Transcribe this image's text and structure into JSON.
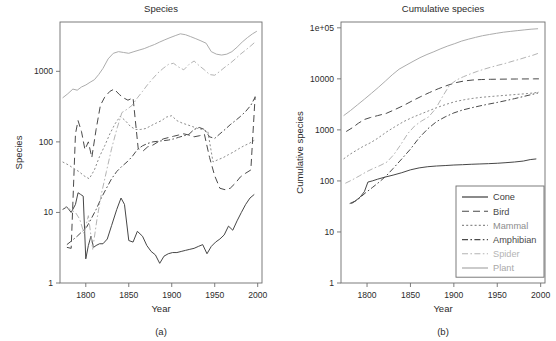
{
  "figure": {
    "caption_a": "(a)",
    "caption_b": "(b)"
  },
  "panel_a": {
    "title": "Species",
    "xlabel": "Year",
    "ylabel": "Species"
  },
  "panel_b": {
    "title": "Cumulative species",
    "xlabel": "Year",
    "ylabel": "Cumulative species"
  },
  "legend": {
    "items": [
      {
        "label": "Cone",
        "color": "#3c3c3c",
        "dash": "none",
        "key": "cone"
      },
      {
        "label": "Bird",
        "color": "#4a4a4a",
        "dash": "long",
        "key": "bird"
      },
      {
        "label": "Mammal",
        "color": "#8c8c8c",
        "dash": "dot",
        "key": "mammal"
      },
      {
        "label": "Amphibian",
        "color": "#4a4a4a",
        "dash": "dashdot",
        "key": "amphibian"
      },
      {
        "label": "Spider",
        "color": "#b4b4b4",
        "dash": "dashdot",
        "key": "spider"
      },
      {
        "label": "Plant",
        "color": "#a8a8a8",
        "dash": "none",
        "key": "plant"
      }
    ]
  },
  "chart_data": [
    {
      "type": "line",
      "panel": "a",
      "title": "Species",
      "xlabel": "Year",
      "ylabel": "Species",
      "yscale": "log",
      "xlim": [
        1770,
        2005
      ],
      "ylim": [
        1,
        5000
      ],
      "xticks": [
        1800,
        1850,
        1900,
        1950,
        2000
      ],
      "xticklabels": [
        "1800",
        "1850",
        "1900",
        "1950",
        "2000"
      ],
      "yticks": [
        1,
        10,
        100,
        1000
      ],
      "yticklabels": [
        "1",
        "10",
        "100",
        "1000"
      ],
      "grid": false,
      "legend_position": "none",
      "series": [
        {
          "name": "Cone",
          "x": [
            1773,
            1778,
            1783,
            1788,
            1791,
            1794,
            1797,
            1800,
            1803,
            1806,
            1809,
            1812,
            1816,
            1820,
            1825,
            1830,
            1836,
            1841,
            1845,
            1850,
            1855,
            1860,
            1866,
            1871,
            1876,
            1881,
            1886,
            1891,
            1896,
            1901,
            1906,
            1911,
            1916,
            1921,
            1926,
            1931,
            1936,
            1941,
            1946,
            1951,
            1956,
            1961,
            1966,
            1971,
            1976,
            1981,
            1986,
            1991,
            1996
          ],
          "y": [
            11,
            12,
            10,
            13,
            19,
            18,
            17,
            2.2,
            3.4,
            4.6,
            3.2,
            3.4,
            3.6,
            3.6,
            4.2,
            6.5,
            11,
            16,
            13,
            4.0,
            3.8,
            5.4,
            4.6,
            3.4,
            2.8,
            2.5,
            1.9,
            2.4,
            2.6,
            2.7,
            2.7,
            2.8,
            2.9,
            3.0,
            3.1,
            3.3,
            3.5,
            2.6,
            3.3,
            3.8,
            4.2,
            4.8,
            6.4,
            5.6,
            7.6,
            10,
            13,
            16,
            18
          ]
        },
        {
          "name": "Bird",
          "x": [
            1778,
            1783,
            1788,
            1791,
            1795,
            1799,
            1803,
            1807,
            1812,
            1817,
            1822,
            1828,
            1833,
            1839,
            1844,
            1849,
            1855,
            1861,
            1867,
            1872,
            1878,
            1884,
            1890,
            1896,
            1902,
            1908,
            1914,
            1920,
            1926,
            1932,
            1938,
            1944,
            1950,
            1956,
            1962,
            1968,
            1974,
            1980,
            1986,
            1992,
            1997
          ],
          "y": [
            3.2,
            3.1,
            130,
            200,
            140,
            78,
            100,
            60,
            150,
            330,
            430,
            520,
            560,
            470,
            420,
            390,
            420,
            80,
            75,
            85,
            90,
            100,
            110,
            115,
            120,
            125,
            130,
            125,
            118,
            122,
            128,
            60,
            33,
            22,
            21,
            22,
            26,
            32,
            36,
            40,
            440
          ]
        },
        {
          "name": "Mammal",
          "x": [
            1773,
            1780,
            1786,
            1792,
            1798,
            1804,
            1810,
            1816,
            1822,
            1828,
            1834,
            1840,
            1846,
            1852,
            1858,
            1864,
            1870,
            1876,
            1882,
            1888,
            1894,
            1900,
            1906,
            1912,
            1918,
            1924,
            1930,
            1936,
            1942,
            1948,
            1954,
            1960,
            1966,
            1972,
            1978,
            1984,
            1990,
            1996
          ],
          "y": [
            52,
            47,
            42,
            38,
            33,
            30,
            40,
            62,
            88,
            130,
            180,
            230,
            200,
            165,
            150,
            150,
            155,
            170,
            185,
            200,
            225,
            235,
            200,
            185,
            175,
            165,
            155,
            150,
            140,
            52,
            56,
            60,
            66,
            72,
            80,
            88,
            95,
            105
          ]
        },
        {
          "name": "Amphibian",
          "x": [
            1778,
            1784,
            1790,
            1796,
            1801,
            1806,
            1812,
            1818,
            1824,
            1830,
            1836,
            1842,
            1848,
            1854,
            1860,
            1866,
            1872,
            1878,
            1884,
            1890,
            1896,
            1902,
            1908,
            1914,
            1920,
            1926,
            1932,
            1938,
            1944,
            1950,
            1956,
            1962,
            1968,
            1974,
            1980,
            1986,
            1992,
            1997
          ],
          "y": [
            3.5,
            4.0,
            4.6,
            5.4,
            6.2,
            8.0,
            11,
            16,
            22,
            30,
            38,
            45,
            52,
            62,
            78,
            88,
            95,
            100,
            102,
            104,
            106,
            110,
            116,
            122,
            128,
            150,
            160,
            150,
            118,
            112,
            130,
            150,
            175,
            200,
            230,
            270,
            330,
            430
          ]
        },
        {
          "name": "Spider",
          "x": [
            1776,
            1782,
            1788,
            1793,
            1798,
            1803,
            1808,
            1813,
            1818,
            1824,
            1830,
            1836,
            1842,
            1848,
            1854,
            1860,
            1866,
            1872,
            1878,
            1884,
            1890,
            1896,
            1902,
            1908,
            1914,
            1920,
            1926,
            1932,
            1938,
            1944,
            1950,
            1956,
            1962,
            1968,
            1974,
            1980,
            1986,
            1992,
            1997
          ],
          "y": [
            12,
            11,
            10,
            8.0,
            5.0,
            9.0,
            3.0,
            8.0,
            18,
            38,
            80,
            150,
            260,
            290,
            330,
            420,
            520,
            650,
            790,
            950,
            1100,
            1250,
            1300,
            1150,
            1050,
            1250,
            1400,
            1200,
            1050,
            900,
            880,
            1000,
            1150,
            1300,
            1500,
            1750,
            2000,
            2300,
            2600
          ]
        },
        {
          "name": "Plant",
          "x": [
            1773,
            1779,
            1785,
            1790,
            1795,
            1800,
            1805,
            1810,
            1815,
            1820,
            1826,
            1832,
            1838,
            1844,
            1850,
            1856,
            1862,
            1868,
            1874,
            1880,
            1886,
            1892,
            1898,
            1904,
            1910,
            1916,
            1922,
            1928,
            1934,
            1940,
            1946,
            1952,
            1958,
            1964,
            1970,
            1976,
            1982,
            1988,
            1994,
            1999
          ],
          "y": [
            420,
            480,
            560,
            540,
            600,
            640,
            700,
            760,
            900,
            1100,
            1500,
            1800,
            1900,
            1850,
            1800,
            1900,
            2000,
            2100,
            2250,
            2400,
            2600,
            2800,
            3000,
            3200,
            3400,
            3300,
            3100,
            2900,
            2700,
            2500,
            1900,
            1750,
            1700,
            1750,
            1900,
            2200,
            2600,
            3000,
            3400,
            3700
          ]
        }
      ]
    },
    {
      "type": "line",
      "panel": "b",
      "title": "Cumulative species",
      "xlabel": "Year",
      "ylabel": "Cumulative species",
      "yscale": "log",
      "xlim": [
        1770,
        2005
      ],
      "ylim": [
        1,
        130000
      ],
      "xticks": [
        1800,
        1850,
        1900,
        1950,
        2000
      ],
      "xticklabels": [
        "1800",
        "1850",
        "1900",
        "1950",
        "2000"
      ],
      "yticks": [
        1,
        10,
        100,
        1000,
        10000,
        100000
      ],
      "yticklabels": [
        "1",
        "10",
        "100",
        "1000",
        "10000",
        "1e+05"
      ],
      "grid": false,
      "legend_position": "lower-right",
      "series": [
        {
          "name": "Cone",
          "x": [
            1780,
            1786,
            1792,
            1797,
            1801,
            1806,
            1812,
            1820,
            1830,
            1840,
            1850,
            1860,
            1870,
            1880,
            1890,
            1900,
            1910,
            1920,
            1930,
            1940,
            1950,
            1960,
            1970,
            1980,
            1988,
            1995
          ],
          "y": [
            36,
            40,
            48,
            62,
            95,
            100,
            108,
            118,
            130,
            145,
            165,
            180,
            190,
            196,
            200,
            205,
            208,
            212,
            215,
            218,
            222,
            228,
            235,
            245,
            262,
            270
          ]
        },
        {
          "name": "Bird",
          "x": [
            1776,
            1783,
            1790,
            1797,
            1804,
            1812,
            1822,
            1832,
            1842,
            1852,
            1862,
            1872,
            1882,
            1892,
            1902,
            1912,
            1922,
            1932,
            1942,
            1952,
            1962,
            1972,
            1982,
            1992,
            1998
          ],
          "y": [
            930,
            1100,
            1350,
            1600,
            1750,
            1900,
            2100,
            2500,
            3000,
            3700,
            4500,
            5400,
            6400,
            7400,
            8400,
            9100,
            9500,
            9700,
            9800,
            9850,
            9900,
            9930,
            9960,
            9990,
            10000
          ]
        },
        {
          "name": "Mammal",
          "x": [
            1773,
            1780,
            1788,
            1796,
            1804,
            1812,
            1822,
            1832,
            1842,
            1852,
            1862,
            1872,
            1882,
            1892,
            1902,
            1912,
            1922,
            1932,
            1942,
            1952,
            1962,
            1972,
            1982,
            1992,
            1998
          ],
          "y": [
            270,
            330,
            400,
            480,
            560,
            680,
            900,
            1150,
            1450,
            1750,
            2050,
            2400,
            2800,
            3200,
            3600,
            3900,
            4150,
            4350,
            4500,
            4650,
            4800,
            4950,
            5100,
            5300,
            5500
          ]
        },
        {
          "name": "Amphibian",
          "x": [
            1782,
            1790,
            1798,
            1806,
            1814,
            1822,
            1830,
            1840,
            1850,
            1860,
            1870,
            1880,
            1890,
            1900,
            1910,
            1920,
            1930,
            1940,
            1950,
            1960,
            1970,
            1980,
            1990,
            1997
          ],
          "y": [
            36,
            44,
            58,
            74,
            95,
            125,
            175,
            270,
            420,
            700,
            1050,
            1450,
            1800,
            2150,
            2450,
            2700,
            2950,
            3200,
            3450,
            3750,
            4100,
            4500,
            4950,
            5300
          ]
        },
        {
          "name": "Spider",
          "x": [
            1775,
            1783,
            1791,
            1799,
            1807,
            1815,
            1823,
            1831,
            1839,
            1847,
            1855,
            1863,
            1871,
            1879,
            1887,
            1895,
            1903,
            1911,
            1919,
            1927,
            1935,
            1943,
            1951,
            1959,
            1967,
            1975,
            1983,
            1991,
            1998
          ],
          "y": [
            90,
            105,
            125,
            150,
            175,
            200,
            235,
            330,
            520,
            850,
            1200,
            1500,
            1800,
            2600,
            4500,
            7500,
            9500,
            11000,
            12500,
            14000,
            15500,
            17000,
            18500,
            20000,
            22000,
            24000,
            26500,
            29000,
            32000
          ]
        },
        {
          "name": "Plant",
          "x": [
            1773,
            1781,
            1789,
            1797,
            1805,
            1813,
            1821,
            1829,
            1837,
            1845,
            1853,
            1861,
            1869,
            1877,
            1885,
            1893,
            1901,
            1909,
            1917,
            1925,
            1933,
            1941,
            1949,
            1957,
            1965,
            1973,
            1981,
            1989,
            1997
          ],
          "y": [
            1900,
            2400,
            3100,
            4000,
            5200,
            6800,
            9000,
            12000,
            15500,
            18500,
            22000,
            26000,
            30000,
            34000,
            39000,
            44000,
            49000,
            55000,
            60000,
            65000,
            70000,
            74000,
            78000,
            82000,
            85000,
            88000,
            91000,
            94000,
            96000
          ]
        }
      ]
    }
  ]
}
